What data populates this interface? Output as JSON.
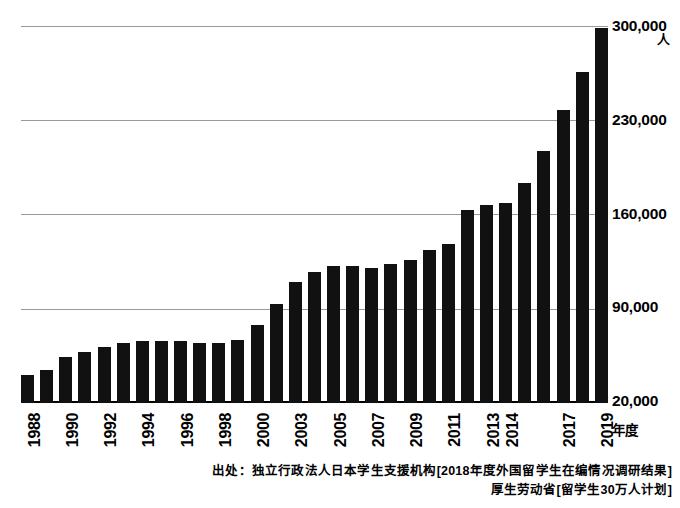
{
  "chart_data": {
    "type": "bar",
    "title": "",
    "xlabel": "年度",
    "ylabel": "",
    "yunit": "人",
    "ylim": [
      20000,
      300000
    ],
    "grid": true,
    "legend": "none",
    "ytick_labels": [
      "300,000",
      "230,000",
      "160,000",
      "90,000",
      "20,000"
    ],
    "ytick_values": [
      300000,
      230000,
      160000,
      90000,
      20000
    ],
    "categories": [
      "1988",
      "1989",
      "1990",
      "1991",
      "1992",
      "1993",
      "1994",
      "1995",
      "1996",
      "1997",
      "1998",
      "1999",
      "2000",
      "2002",
      "2003",
      "2004",
      "2005",
      "2006",
      "2007",
      "2008",
      "2009",
      "2010",
      "2011",
      "2012",
      "2013",
      "2014",
      "2015",
      "2016",
      "2017",
      "2018",
      "2019"
    ],
    "xtick_labels": [
      "1988",
      "",
      "1990",
      "",
      "1992",
      "",
      "1994",
      "",
      "1996",
      "",
      "1998",
      "",
      "2000",
      "",
      "2003",
      "",
      "2005",
      "",
      "2007",
      "",
      "2009",
      "",
      "2011",
      "",
      "2013",
      "2014",
      "",
      "",
      "2017",
      "",
      "2019"
    ],
    "values": [
      41000,
      45000,
      54000,
      58000,
      62000,
      65000,
      66000,
      66000,
      66000,
      65000,
      65000,
      67000,
      78000,
      94000,
      110000,
      118000,
      122000,
      122000,
      121000,
      124000,
      127000,
      134000,
      139000,
      164000,
      168000,
      169000,
      184000,
      208000,
      239000,
      267000,
      300000
    ],
    "annotations": []
  },
  "source": {
    "line1": "出处：独立行政法人日本学生支援机构[2018年度外国留学生在编情况调研结果]",
    "line2": "厚生劳动省[留学生30万人计划]"
  },
  "axis": {
    "x_unit_label": "年度"
  }
}
